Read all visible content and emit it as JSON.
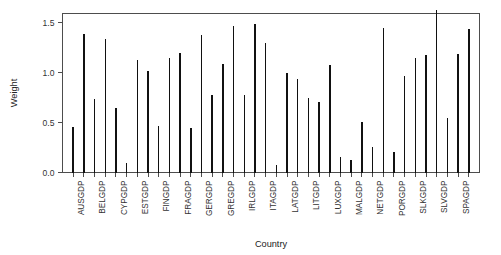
{
  "chart_data": {
    "type": "bar",
    "title": "",
    "subtitle": "",
    "xlabel": "Country",
    "ylabel": "Weight",
    "ylim": [
      0.0,
      1.63
    ],
    "yticks": [
      0.0,
      0.5,
      1.0,
      1.5
    ],
    "ytick_labels": [
      "0.0",
      "0.5",
      "1.0",
      "1.5"
    ],
    "grid": false,
    "legend": null,
    "bar_color": "#111111",
    "axis_color": "#4d4d4d",
    "categories": [
      "AUSGDP",
      "AUTGDP",
      "BELGDP",
      "BULGDP",
      "CYPGDP",
      "CZEGDP",
      "ESTGDP",
      "FINGDP2",
      "FINGDP",
      "FRAGDP2",
      "FRAGDP",
      "GBRGDP",
      "GERGDP",
      "GRCGDP",
      "GREGDP",
      "HUNGDP",
      "IRLGDP",
      "ISLGDP",
      "ITAGDP",
      "ITAGDP2",
      "LATGDP",
      "LIEGDP",
      "LITGDP",
      "LUXGDP2",
      "LUXGDP",
      "MACGDP",
      "MALGDP",
      "MONGDP",
      "NETGDP",
      "NORGDP",
      "PORGDP",
      "ROMGDP",
      "SLKGDP",
      "SLOGDP",
      "SLVGDP",
      "SPAGDP2",
      "SPAGDP",
      "SWEGDP"
    ],
    "tick_labels_shown": [
      "AUSGDP",
      "BELGDP",
      "CYPGDP",
      "ESTGDP",
      "FINGDP",
      "FRAGDP",
      "GERGDP",
      "GREGDP",
      "IRLGDP",
      "ITAGDP",
      "LATGDP",
      "LITGDP",
      "LUXGDP",
      "MALGDP",
      "NETGDP",
      "PORGDP",
      "SLKGDP",
      "SLVGDP",
      "SPAGDP"
    ],
    "values": [
      0.46,
      1.39,
      0.74,
      1.34,
      0.65,
      0.1,
      1.13,
      1.02,
      0.47,
      1.15,
      1.2,
      0.45,
      1.38,
      0.78,
      1.09,
      1.47,
      0.78,
      1.49,
      1.3,
      0.08,
      1.0,
      0.94,
      0.75,
      0.71,
      1.08,
      0.16,
      0.13,
      0.51,
      0.26,
      1.45,
      0.21,
      0.97,
      1.15,
      1.18,
      1.63,
      0.55,
      1.19,
      1.44
    ]
  }
}
